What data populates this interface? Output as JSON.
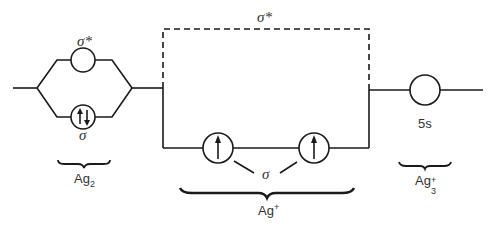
{
  "diagram": {
    "type": "molecular-orbital-scheme",
    "labels": {
      "ag2_sigma_star": "σ*",
      "ag2_sigma": "σ",
      "ag2_base": "Ag",
      "ag2_sub": "2",
      "agplus_sigma_star": "σ*",
      "agplus_sigma": "σ",
      "agplus_base": "Ag",
      "agplus_sup": "+",
      "ag3_orbital": "5s",
      "ag3_base": "Ag",
      "ag3_sub": "3",
      "ag3_sup": "+"
    },
    "orbitals": [
      {
        "id": "ag2-sigma-star",
        "electrons": 0
      },
      {
        "id": "ag2-sigma",
        "electrons": 2,
        "spin": "paired"
      },
      {
        "id": "agplus-sigma-left",
        "electrons": 1,
        "spin": "up"
      },
      {
        "id": "agplus-sigma-right",
        "electrons": 1,
        "spin": "up"
      },
      {
        "id": "ag3-5s",
        "electrons": 0
      }
    ],
    "colors": {
      "line": "#1a1a1a",
      "text": "#333333"
    }
  }
}
